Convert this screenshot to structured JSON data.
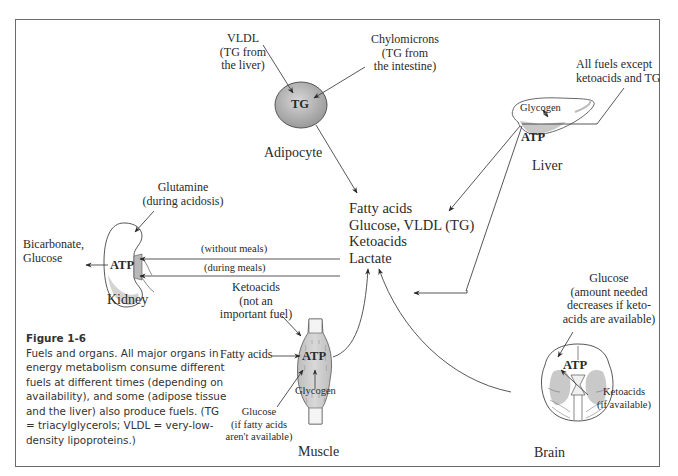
{
  "diagram": {
    "center_fuels": [
      "Fatty acids",
      "Glucose, VLDL (TG)",
      "Ketoacids",
      "Lactate"
    ],
    "adipocyte": {
      "name": "Adipocyte",
      "content": "TG",
      "input_vldl": [
        "VLDL",
        "(TG from",
        "the liver)"
      ],
      "input_chylomicrons": [
        "Chylomicrons",
        "(TG from",
        "the intestine)"
      ]
    },
    "liver": {
      "name": "Liver",
      "glycogen": "Glycogen",
      "atp": "ATP",
      "input": [
        "All fuels except",
        "ketoacids and TG"
      ]
    },
    "kidney": {
      "name": "Kidney",
      "atp": "ATP",
      "input": [
        "Glutamine",
        "(during acidosis)"
      ],
      "output": [
        "Bicarbonate,",
        "Glucose"
      ],
      "arrow_without_meals": "(without meals)",
      "arrow_during_meals": "(during meals)"
    },
    "muscle": {
      "name": "Muscle",
      "atp": "ATP",
      "glycogen": "Glycogen",
      "input_ketoacids": [
        "Ketoacids",
        "(not an",
        "important fuel)"
      ],
      "input_fatty_acids": "Fatty acids",
      "input_glucose": [
        "Glucose",
        "(if fatty acids",
        "aren't available)"
      ]
    },
    "brain": {
      "name": "Brain",
      "atp": "ATP",
      "input_glucose": [
        "Glucose",
        "(amount needed",
        "decreases if keto-",
        "acids are available)"
      ],
      "input_ketoacids": [
        "Ketoacids",
        "(if available)"
      ]
    }
  },
  "caption": {
    "figure_label": "Figure 1-6",
    "text": "Fuels and organs. All major organs in energy metabolism consume different fuels at different times (depending on availability), and some (adipose tissue and the liver) also produce fuels. (TG = triacylglycerols; VLDL = very-low-density lipoproteins.)"
  },
  "colors": {
    "frame": "#6a6a6a",
    "line": "#333333",
    "organ_fill": "#d9d9d9",
    "text": "#2a2a2a"
  }
}
